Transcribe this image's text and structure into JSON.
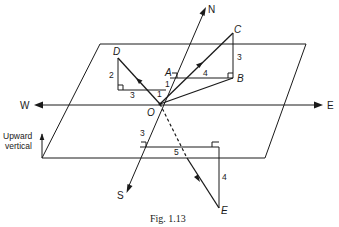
{
  "figure": {
    "caption": "Fig. 1.13",
    "directions": {
      "north": "N",
      "south": "S",
      "east": "E",
      "west": "W"
    },
    "vertical_label_line1": "Upward",
    "vertical_label_line2": "vertical",
    "origin": "O",
    "points": {
      "A": "A",
      "B": "B",
      "C": "C",
      "D": "D",
      "E": "E"
    },
    "lengths": {
      "OA": "1",
      "AB": "4",
      "BC": "3",
      "D_horizontal": "3",
      "D_vertical": "2",
      "D_north_offset": "1",
      "E_south": "3",
      "E_east": "5",
      "E_down": "4"
    }
  }
}
